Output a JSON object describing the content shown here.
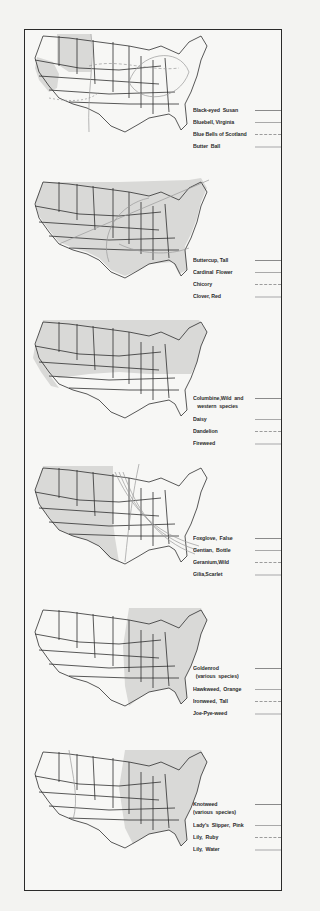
{
  "figure": {
    "panels": [
      {
        "id": "panel-1",
        "legend": [
          {
            "label": "Black-eyed  Susan",
            "line_style": "solid-dark"
          },
          {
            "label": "Bluebell, Virginia",
            "line_style": "solid-light"
          },
          {
            "label": "Blue Bells of Scotland",
            "line_style": "dashed"
          },
          {
            "label": "Butter  Ball",
            "line_style": "band"
          }
        ]
      },
      {
        "id": "panel-2",
        "legend": [
          {
            "label": "Buttercup, Tall",
            "line_style": "solid-dark"
          },
          {
            "label": "Cardinal  Flower",
            "line_style": "solid-light"
          },
          {
            "label": "Chicory",
            "line_style": "dashed"
          },
          {
            "label": "Clover, Red",
            "line_style": "band"
          }
        ]
      },
      {
        "id": "panel-3",
        "legend": [
          {
            "label": "Columbine,Wild  and\n   western  species",
            "line_style": "solid-dark"
          },
          {
            "label": "Daisy",
            "line_style": "solid-light"
          },
          {
            "label": "Dandelion",
            "line_style": "dashed"
          },
          {
            "label": "Fireweed",
            "line_style": "band"
          }
        ]
      },
      {
        "id": "panel-4",
        "legend": [
          {
            "label": "Foxglove,  False",
            "line_style": "solid-dark"
          },
          {
            "label": "Gentian,  Bottle",
            "line_style": "solid-light"
          },
          {
            "label": "Geranium,Wild",
            "line_style": "dashed"
          },
          {
            "label": "Gilia,Scarlet",
            "line_style": "band"
          }
        ]
      },
      {
        "id": "panel-5",
        "legend": [
          {
            "label": "Goldenrod\n  (various  species)",
            "line_style": "solid-dark"
          },
          {
            "label": "Hawkweed,  Orange",
            "line_style": "solid-light"
          },
          {
            "label": "Ironweed,  Tall",
            "line_style": "dashed"
          },
          {
            "label": "Joe-Pye-weed",
            "line_style": "band"
          }
        ]
      },
      {
        "id": "panel-6",
        "legend": [
          {
            "label": "Knotweed\n(various  species)",
            "line_style": "solid-dark"
          },
          {
            "label": "Lady's  Slipper,  Pink",
            "line_style": "solid-light"
          },
          {
            "label": "Lily,  Ruby",
            "line_style": "dashed"
          },
          {
            "label": "Lily,  Water",
            "line_style": "band"
          }
        ]
      }
    ],
    "colors": {
      "background": "#f3f3f1",
      "frame": "#2a2a2a",
      "state_lines": "#2e2e2e",
      "range_fill": "#d9d9d7",
      "text": "#2b2b2b"
    }
  }
}
